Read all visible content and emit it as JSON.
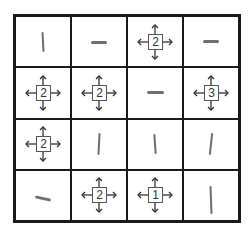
{
  "puzzle": {
    "rows": 4,
    "cols": 4,
    "cells": [
      [
        {
          "type": "line",
          "dir": "v"
        },
        {
          "type": "line",
          "dir": "h"
        },
        {
          "type": "clue",
          "value": "2"
        },
        {
          "type": "line",
          "dir": "h"
        }
      ],
      [
        {
          "type": "clue",
          "value": "2"
        },
        {
          "type": "clue",
          "value": "2"
        },
        {
          "type": "line",
          "dir": "h"
        },
        {
          "type": "clue",
          "value": "3"
        }
      ],
      [
        {
          "type": "clue",
          "value": "2"
        },
        {
          "type": "line",
          "dir": "v"
        },
        {
          "type": "line",
          "dir": "v"
        },
        {
          "type": "line",
          "dir": "v"
        }
      ],
      [
        {
          "type": "line",
          "dir": "h"
        },
        {
          "type": "clue",
          "value": "2"
        },
        {
          "type": "clue",
          "value": "1"
        },
        {
          "type": "line",
          "dir": "v"
        }
      ]
    ]
  },
  "clues": {
    "r0c2": "2",
    "r1c0": "2",
    "r1c1": "2",
    "r1c3": "3",
    "r2c0": "2",
    "r3c1": "2",
    "r3c2": "1"
  }
}
